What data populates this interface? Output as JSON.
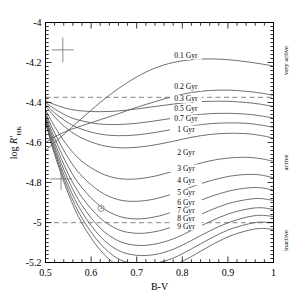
{
  "chart_data": {
    "type": "line",
    "title": "",
    "xlabel": "B-V",
    "ylabel": "log R'_HK",
    "xlim": [
      0.5,
      1.0
    ],
    "ylim": [
      -5.2,
      -4.0
    ],
    "grid": false,
    "legend_position": "inline-right-of-curves",
    "xticks": [
      "0.5",
      "0.6",
      "0.7",
      "0.8",
      "0.9",
      "1"
    ],
    "xtick_values": [
      0.5,
      0.6,
      0.7,
      0.8,
      0.9,
      1.0
    ],
    "yticks": [
      "-4",
      "-4.2",
      "-4.4",
      "-4.6",
      "-4.8",
      "-5",
      "-5.2"
    ],
    "ytick_values": [
      -4.0,
      -4.2,
      -4.4,
      -4.6,
      -4.8,
      -5.0,
      -5.2
    ],
    "series": [
      {
        "name": "0.1 Gyr",
        "label": "0.1 Gyr",
        "label_x": 0.808,
        "label_y": -4.176,
        "x": [
          0.5,
          0.52,
          0.55,
          0.58,
          0.62,
          0.66,
          0.7,
          0.74,
          0.78,
          0.82,
          0.86,
          0.9,
          0.94,
          0.97,
          1.0
        ],
        "y": [
          -4.64,
          -4.6,
          -4.54,
          -4.478,
          -4.4,
          -4.33,
          -4.272,
          -4.228,
          -4.2,
          -4.186,
          -4.182,
          -4.186,
          -4.196,
          -4.206,
          -4.218
        ]
      },
      {
        "name": "0.2 Gyr",
        "label": "0.2 Gyr",
        "label_x": 0.808,
        "label_y": -4.332,
        "x": [
          0.5,
          0.52,
          0.55,
          0.58,
          0.62,
          0.66,
          0.7,
          0.74,
          0.78,
          0.82,
          0.86,
          0.9,
          0.94,
          0.97,
          1.0
        ],
        "y": [
          -4.6,
          -4.572,
          -4.54,
          -4.516,
          -4.486,
          -4.456,
          -4.424,
          -4.396,
          -4.37,
          -4.35,
          -4.34,
          -4.338,
          -4.344,
          -4.352,
          -4.364
        ]
      },
      {
        "name": "0.3 Gyr",
        "label": "0.3 Gyr",
        "label_x": 0.808,
        "label_y": -4.392,
        "x": [
          0.5,
          0.52,
          0.55,
          0.58,
          0.62,
          0.66,
          0.7,
          0.74,
          0.78,
          0.82,
          0.86,
          0.9,
          0.94,
          0.97,
          1.0
        ],
        "y": [
          -4.392,
          -4.41,
          -4.432,
          -4.442,
          -4.446,
          -4.442,
          -4.432,
          -4.42,
          -4.408,
          -4.398,
          -4.394,
          -4.394,
          -4.4,
          -4.408,
          -4.42
        ]
      },
      {
        "name": "0.5 Gyr",
        "label": "0.5 Gyr",
        "label_x": 0.808,
        "label_y": -4.444,
        "x": [
          0.5,
          0.52,
          0.55,
          0.58,
          0.62,
          0.66,
          0.7,
          0.74,
          0.78,
          0.82,
          0.86,
          0.9,
          0.94,
          0.97,
          1.0
        ],
        "y": [
          -4.4,
          -4.432,
          -4.47,
          -4.492,
          -4.508,
          -4.51,
          -4.504,
          -4.492,
          -4.478,
          -4.464,
          -4.456,
          -4.454,
          -4.458,
          -4.466,
          -4.478
        ]
      },
      {
        "name": "0.7 Gyr",
        "label": "0.7 Gyr",
        "label_x": 0.808,
        "label_y": -4.492,
        "x": [
          0.5,
          0.52,
          0.55,
          0.58,
          0.62,
          0.66,
          0.7,
          0.74,
          0.78,
          0.82,
          0.86,
          0.9,
          0.94,
          0.97,
          1.0
        ],
        "y": [
          -4.408,
          -4.452,
          -4.502,
          -4.534,
          -4.558,
          -4.566,
          -4.562,
          -4.55,
          -4.534,
          -4.518,
          -4.506,
          -4.502,
          -4.504,
          -4.512,
          -4.524
        ]
      },
      {
        "name": "1 Gyr",
        "label": "1 Gyr",
        "label_x": 0.808,
        "label_y": -4.546,
        "x": [
          0.5,
          0.52,
          0.55,
          0.58,
          0.62,
          0.66,
          0.7,
          0.74,
          0.78,
          0.82,
          0.86,
          0.9,
          0.94,
          0.97,
          1.0
        ],
        "y": [
          -4.416,
          -4.472,
          -4.536,
          -4.578,
          -4.612,
          -4.626,
          -4.624,
          -4.612,
          -4.594,
          -4.574,
          -4.56,
          -4.554,
          -4.556,
          -4.564,
          -4.578
        ]
      },
      {
        "name": "2 Gyr",
        "label": "2 Gyr",
        "label_x": 0.808,
        "label_y": -4.66,
        "x": [
          0.5,
          0.52,
          0.55,
          0.58,
          0.62,
          0.66,
          0.7,
          0.74,
          0.78,
          0.82,
          0.86,
          0.9,
          0.94,
          0.97,
          1.0
        ],
        "y": [
          -4.436,
          -4.52,
          -4.622,
          -4.694,
          -4.752,
          -4.78,
          -4.782,
          -4.768,
          -4.744,
          -4.716,
          -4.692,
          -4.678,
          -4.674,
          -4.68,
          -4.694
        ]
      },
      {
        "name": "3 Gyr",
        "label": "3 Gyr",
        "label_x": 0.808,
        "label_y": -4.74,
        "x": [
          0.5,
          0.52,
          0.55,
          0.58,
          0.62,
          0.66,
          0.7,
          0.74,
          0.78,
          0.82,
          0.86,
          0.9,
          0.94,
          0.97,
          1.0
        ],
        "y": [
          -4.45,
          -4.552,
          -4.678,
          -4.768,
          -4.846,
          -4.886,
          -4.894,
          -4.882,
          -4.856,
          -4.822,
          -4.792,
          -4.77,
          -4.76,
          -4.762,
          -4.776
        ]
      },
      {
        "name": "4 Gyr",
        "label": "4 Gyr",
        "label_x": 0.808,
        "label_y": -4.804,
        "x": [
          0.5,
          0.52,
          0.55,
          0.58,
          0.62,
          0.66,
          0.7,
          0.74,
          0.78,
          0.82,
          0.86,
          0.9,
          0.94,
          0.97,
          1.0
        ],
        "y": [
          -4.462,
          -4.578,
          -4.722,
          -4.826,
          -4.918,
          -4.968,
          -4.982,
          -4.972,
          -4.946,
          -4.908,
          -4.872,
          -4.844,
          -4.828,
          -4.826,
          -4.838
        ]
      },
      {
        "name": "5 Gyr",
        "label": "5 Gyr",
        "label_x": 0.808,
        "label_y": -4.86,
        "x": [
          0.5,
          0.52,
          0.55,
          0.58,
          0.62,
          0.66,
          0.7,
          0.74,
          0.78,
          0.82,
          0.86,
          0.9,
          0.94,
          0.97,
          1.0
        ],
        "y": [
          -4.472,
          -4.6,
          -4.758,
          -4.874,
          -4.978,
          -5.036,
          -5.054,
          -5.046,
          -5.02,
          -4.98,
          -4.94,
          -4.906,
          -4.886,
          -4.88,
          -4.89
        ]
      },
      {
        "name": "6 Gyr",
        "label": "6 Gyr",
        "label_x": 0.808,
        "label_y": -4.91,
        "x": [
          0.5,
          0.52,
          0.55,
          0.58,
          0.62,
          0.66,
          0.7,
          0.74,
          0.78,
          0.82,
          0.86,
          0.9,
          0.94,
          0.97,
          1.0
        ],
        "y": [
          -4.48,
          -4.618,
          -4.788,
          -4.914,
          -5.028,
          -5.092,
          -5.114,
          -5.108,
          -5.082,
          -5.04,
          -4.996,
          -4.958,
          -4.934,
          -4.926,
          -4.934
        ]
      },
      {
        "name": "7 Gyr",
        "label": "7 Gyr",
        "label_x": 0.808,
        "label_y": -4.952,
        "x": [
          0.5,
          0.52,
          0.55,
          0.58,
          0.62,
          0.66,
          0.7,
          0.74,
          0.78,
          0.82,
          0.86,
          0.9,
          0.94,
          0.97,
          1.0
        ],
        "y": [
          -4.488,
          -4.634,
          -4.814,
          -4.948,
          -5.07,
          -5.14,
          -5.164,
          -5.16,
          -5.134,
          -5.09,
          -5.042,
          -5.002,
          -4.974,
          -4.964,
          -4.97
        ]
      },
      {
        "name": "8 Gyr",
        "label": "8 Gyr",
        "label_x": 0.808,
        "label_y": -4.992,
        "x": [
          0.5,
          0.52,
          0.55,
          0.58,
          0.62,
          0.66,
          0.7,
          0.74,
          0.78,
          0.82,
          0.86,
          0.9,
          0.94,
          0.97,
          1.0
        ],
        "y": [
          -4.494,
          -4.648,
          -4.836,
          -4.978,
          -5.106,
          -5.182,
          -5.208,
          -5.204,
          -5.178,
          -5.132,
          -5.082,
          -5.038,
          -5.01,
          -4.998,
          -5.002
        ]
      },
      {
        "name": "9 Gyr",
        "label": "9 Gyr",
        "label_x": 0.808,
        "label_y": -5.03,
        "x": [
          0.5,
          0.52,
          0.55,
          0.58,
          0.62,
          0.66,
          0.7,
          0.74,
          0.78,
          0.82,
          0.86,
          0.9,
          0.94,
          0.97,
          1.0
        ],
        "y": [
          -4.5,
          -4.66,
          -4.856,
          -5.004,
          -5.138,
          -5.218,
          -5.248,
          -5.244,
          -5.216,
          -5.17,
          -5.118,
          -5.072,
          -5.042,
          -5.03,
          -5.034
        ]
      }
    ],
    "reference_lines": [
      {
        "name": "very-active-active-boundary",
        "orientation": "horizontal",
        "y": -4.374,
        "style": "dashed"
      },
      {
        "name": "active-inactive-boundary",
        "orientation": "horizontal",
        "y": -5.001,
        "style": "dashed"
      }
    ],
    "annotations": [
      {
        "name": "error-bar-upper",
        "x": 0.538,
        "y": -4.137,
        "xerr": 0.024,
        "yerr": 0.062
      },
      {
        "name": "error-bar-lower",
        "x": 0.534,
        "y": -4.782,
        "xerr": 0.024,
        "yerr": 0.055
      },
      {
        "name": "sun-marker",
        "symbol": "⊙",
        "x": 0.622,
        "y": -4.929
      }
    ],
    "regime_labels": [
      {
        "name": "very-active",
        "text": "very active",
        "y": -4.19
      },
      {
        "name": "active",
        "text": "active",
        "y": -4.7
      },
      {
        "name": "inactive",
        "text": "inactive",
        "y": -5.09
      }
    ]
  }
}
